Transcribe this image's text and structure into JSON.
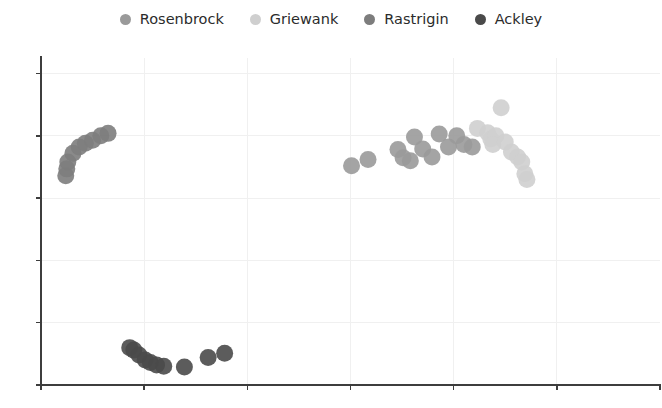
{
  "chart_data": {
    "type": "scatter",
    "title": "",
    "xlabel": "",
    "ylabel": "",
    "grid": true,
    "legend_position": "top-center",
    "xlim": [
      0,
      6
    ],
    "ylim": [
      0,
      5.25
    ],
    "xticks": [
      0,
      1,
      2,
      3,
      4,
      5
    ],
    "yticks": [
      0,
      1,
      2,
      3,
      4,
      5
    ],
    "xticklabels": [
      "",
      "",
      "",
      "",
      "",
      ""
    ],
    "yticklabels": [
      "",
      "",
      "",
      "",
      "",
      ""
    ],
    "series": [
      {
        "name": "Rosenbrock",
        "color": "#9a9a9a",
        "points": [
          [
            3.01,
            3.52
          ],
          [
            3.17,
            3.62
          ],
          [
            3.46,
            3.78
          ],
          [
            3.51,
            3.65
          ],
          [
            3.58,
            3.6
          ],
          [
            3.62,
            3.98
          ],
          [
            3.7,
            3.79
          ],
          [
            3.79,
            3.66
          ],
          [
            3.86,
            4.03
          ],
          [
            3.95,
            3.82
          ],
          [
            4.03,
            4.0
          ],
          [
            4.1,
            3.86
          ],
          [
            4.18,
            3.82
          ]
        ]
      },
      {
        "name": "Griewank",
        "color": "#cfcfcf",
        "points": [
          [
            4.23,
            4.12
          ],
          [
            4.33,
            4.05
          ],
          [
            4.36,
            3.95
          ],
          [
            4.41,
            4.0
          ],
          [
            4.38,
            3.86
          ],
          [
            4.46,
            4.45
          ],
          [
            4.5,
            3.9
          ],
          [
            4.56,
            3.74
          ],
          [
            4.62,
            3.66
          ],
          [
            4.66,
            3.58
          ],
          [
            4.69,
            3.39
          ],
          [
            4.71,
            3.3
          ]
        ]
      },
      {
        "name": "Rastrigin",
        "color": "#7d7d7d",
        "points": [
          [
            0.24,
            3.36
          ],
          [
            0.25,
            3.47
          ],
          [
            0.26,
            3.58
          ],
          [
            0.31,
            3.72
          ],
          [
            0.37,
            3.82
          ],
          [
            0.43,
            3.88
          ],
          [
            0.5,
            3.93
          ],
          [
            0.58,
            4.0
          ],
          [
            0.65,
            4.04
          ]
        ]
      },
      {
        "name": "Ackley",
        "color": "#4a4a4a",
        "points": [
          [
            0.86,
            0.6
          ],
          [
            0.9,
            0.56
          ],
          [
            0.95,
            0.48
          ],
          [
            1.01,
            0.4
          ],
          [
            1.06,
            0.36
          ],
          [
            1.12,
            0.32
          ],
          [
            1.19,
            0.3
          ],
          [
            1.39,
            0.29
          ],
          [
            1.62,
            0.44
          ],
          [
            1.78,
            0.51
          ]
        ]
      }
    ]
  },
  "legend": {
    "entries": [
      {
        "label": "Rosenbrock",
        "color": "#9a9a9a",
        "marker": "circle-marker"
      },
      {
        "label": "Griewank",
        "color": "#cfcfcf",
        "marker": "circle-marker"
      },
      {
        "label": "Rastrigin",
        "color": "#7d7d7d",
        "marker": "circle-marker"
      },
      {
        "label": "Ackley",
        "color": "#4a4a4a",
        "marker": "circle-marker"
      }
    ]
  },
  "style": {
    "background": "#ffffff",
    "axis_color": "#3d3d3d",
    "grid_color": "#f0f0f0",
    "marker_radius_px": 8.5
  },
  "geometry": {
    "plot_left_px": 41,
    "plot_right_px": 660,
    "plot_top_px": 58,
    "plot_bottom_px": 385
  }
}
